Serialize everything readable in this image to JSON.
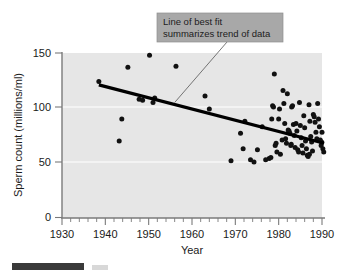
{
  "chart_data": {
    "type": "scatter",
    "title": "",
    "xlabel": "Year",
    "ylabel": "Sperm count (millions/ml)",
    "xlim": [
      1930,
      1990
    ],
    "ylim": [
      0,
      150
    ],
    "x_major_ticks": [
      1930,
      1940,
      1950,
      1960,
      1970,
      1980,
      1990
    ],
    "x_tick_labels": [
      "1930",
      "1940",
      "1950",
      "1960",
      "1970",
      "1980",
      "1990"
    ],
    "x_minor_tick_step": 2,
    "y_major_ticks": [
      0,
      50,
      100,
      150
    ],
    "y_tick_labels": [
      "0",
      "50",
      "100",
      "150"
    ],
    "grid": "horizontal-faint",
    "legend": "none",
    "plot_background_color": "#e6e6e6",
    "point_color": "#111111",
    "trend_line_color": "#000000",
    "annotation_box_color": "#a8a8a8",
    "points": [
      [
        1938.5,
        124
      ],
      [
        1943.2,
        70
      ],
      [
        1943.8,
        90
      ],
      [
        1945.2,
        137
      ],
      [
        1947.8,
        108
      ],
      [
        1948.6,
        107
      ],
      [
        1950.2,
        148
      ],
      [
        1951.0,
        105
      ],
      [
        1951.4,
        109
      ],
      [
        1956.3,
        138
      ],
      [
        1963.0,
        111
      ],
      [
        1964.0,
        99
      ],
      [
        1969.0,
        52
      ],
      [
        1971.2,
        77
      ],
      [
        1971.8,
        63
      ],
      [
        1972.2,
        88
      ],
      [
        1974.3,
        51
      ],
      [
        1975.1,
        62
      ],
      [
        1976.2,
        83
      ],
      [
        1977.8,
        54
      ],
      [
        1978.2,
        55
      ],
      [
        1978.4,
        90
      ],
      [
        1978.6,
        102
      ],
      [
        1978.8,
        101
      ],
      [
        1979.0,
        131
      ],
      [
        1979.2,
        66
      ],
      [
        1979.4,
        68
      ],
      [
        1979.6,
        60
      ],
      [
        1980.0,
        90
      ],
      [
        1980.4,
        58
      ],
      [
        1980.8,
        71
      ],
      [
        1981.0,
        116
      ],
      [
        1981.2,
        104
      ],
      [
        1981.4,
        86
      ],
      [
        1981.6,
        72
      ],
      [
        1981.8,
        68
      ],
      [
        1982.0,
        113
      ],
      [
        1982.2,
        80
      ],
      [
        1982.4,
        79
      ],
      [
        1982.6,
        77
      ],
      [
        1982.8,
        66
      ],
      [
        1983.0,
        101
      ],
      [
        1983.2,
        102
      ],
      [
        1983.4,
        85
      ],
      [
        1983.6,
        75
      ],
      [
        1983.8,
        64
      ],
      [
        1984.0,
        86
      ],
      [
        1984.2,
        79
      ],
      [
        1984.4,
        62
      ],
      [
        1984.6,
        60
      ],
      [
        1985.0,
        84
      ],
      [
        1985.2,
        73
      ],
      [
        1985.4,
        66
      ],
      [
        1985.6,
        59
      ],
      [
        1986.0,
        82
      ],
      [
        1986.2,
        70
      ],
      [
        1986.4,
        63
      ],
      [
        1986.6,
        57
      ],
      [
        1986.8,
        56
      ],
      [
        1987.0,
        103
      ],
      [
        1987.2,
        88
      ],
      [
        1987.4,
        74
      ],
      [
        1987.6,
        69
      ],
      [
        1987.8,
        61
      ],
      [
        1988.0,
        94
      ],
      [
        1988.2,
        92
      ],
      [
        1988.4,
        87
      ],
      [
        1988.6,
        78
      ],
      [
        1988.8,
        72
      ],
      [
        1989.0,
        104
      ],
      [
        1989.2,
        90
      ],
      [
        1989.4,
        83
      ],
      [
        1989.6,
        71
      ],
      [
        1989.8,
        66
      ],
      [
        1990.0,
        78
      ],
      [
        1990.2,
        63
      ],
      [
        1990.4,
        60
      ],
      [
        1973.5,
        53
      ],
      [
        1977.0,
        53
      ],
      [
        1980.2,
        99
      ],
      [
        1982.9,
        67
      ],
      [
        1985.8,
        93
      ],
      [
        1987.1,
        58
      ],
      [
        1989.9,
        69
      ],
      [
        1984.8,
        105
      ]
    ],
    "trend_line": {
      "x_start": 1938.5,
      "y_start": 121,
      "x_end": 1990.5,
      "y_end": 68
    },
    "annotation": {
      "line1": "Line of best fit",
      "line2": "summarizes trend of data",
      "points_to_x": 1956.0,
      "points_to_y": 105
    }
  }
}
